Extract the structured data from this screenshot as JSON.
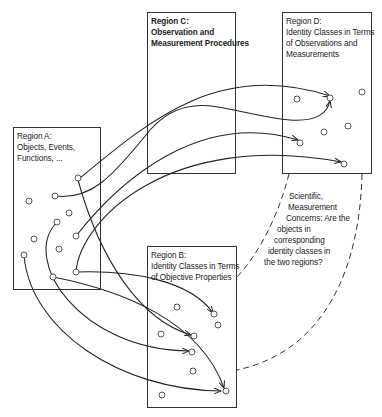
{
  "diagram": {
    "regions": {
      "A": {
        "title": "Region A:",
        "lines": [
          "Objects, Events,",
          "Functions, ..."
        ]
      },
      "B": {
        "title": "Region B:",
        "lines": [
          "Identity Classes in Terms",
          "of Objective Properties"
        ]
      },
      "C": {
        "title": "Region C:",
        "lines": [
          "Observation and",
          "Measurement Procedures"
        ]
      },
      "D": {
        "title": "Region D:",
        "lines": [
          "Identity Classes in Terms",
          "of Observations and",
          "Measurements"
        ]
      }
    },
    "concern": {
      "lines": [
        "Scientific,",
        "Measurement",
        "Concerns: Are the",
        "objects in",
        "corresponding",
        "identity classes in",
        "the two regions?"
      ]
    },
    "colors": {
      "line": "#222222",
      "background": "#ffffff"
    }
  }
}
